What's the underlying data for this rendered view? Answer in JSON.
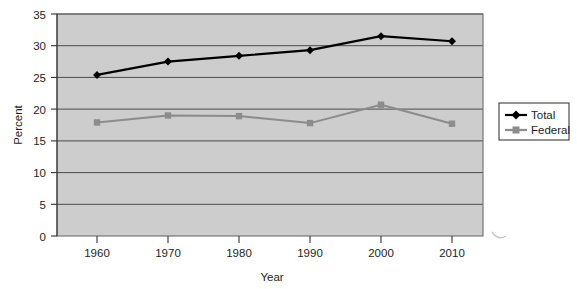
{
  "chart_data": {
    "type": "line",
    "title": "",
    "xlabel": "Year",
    "ylabel": "Percent",
    "categories": [
      "1960",
      "1970",
      "1980",
      "1990",
      "2000",
      "2010"
    ],
    "x": [
      1960,
      1970,
      1980,
      1990,
      2000,
      2010
    ],
    "xlim": [
      1955,
      2015
    ],
    "ylim": [
      0,
      35
    ],
    "yticks": [
      "0",
      "5",
      "10",
      "15",
      "20",
      "25",
      "30",
      "35"
    ],
    "ytick_values": [
      0,
      5,
      10,
      15,
      20,
      25,
      30,
      35
    ],
    "grid": true,
    "legend_position": "right",
    "series": [
      {
        "name": "Total",
        "color": "#000000",
        "marker": "diamond",
        "values": [
          25.4,
          27.5,
          28.4,
          29.3,
          31.5,
          30.7
        ]
      },
      {
        "name": "Federal",
        "color": "#8c8c8c",
        "marker": "square",
        "values": [
          17.9,
          19.0,
          18.9,
          17.8,
          20.7,
          17.7
        ]
      }
    ]
  },
  "legend": {
    "entries": [
      {
        "label": "Total"
      },
      {
        "label": "Federal"
      }
    ]
  },
  "axes": {
    "y_title": "Percent",
    "x_title": "Year"
  }
}
